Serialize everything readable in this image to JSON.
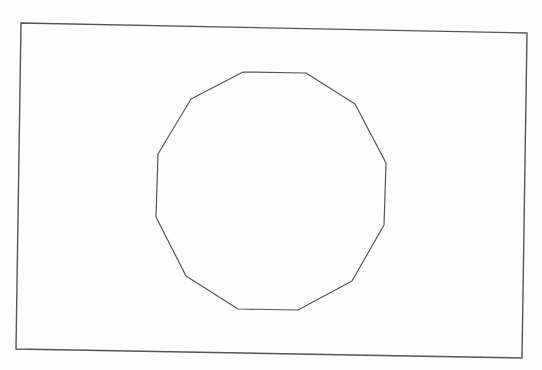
{
  "diagram": {
    "width": 542,
    "height": 370,
    "background": "#fefefe",
    "stroke_color": "#555555",
    "frame": {
      "shape": "quadrilateral",
      "points": [
        [
          21,
          23
        ],
        [
          527,
          33
        ],
        [
          522,
          358
        ],
        [
          16,
          349
        ]
      ],
      "stroke_width": 1.4
    },
    "polygon": {
      "shape": "dodecagon",
      "sides": 12,
      "points": [
        [
          243,
          72
        ],
        [
          306,
          73
        ],
        [
          355,
          104
        ],
        [
          386,
          163
        ],
        [
          384,
          225
        ],
        [
          352,
          281
        ],
        [
          298,
          310
        ],
        [
          238,
          309
        ],
        [
          186,
          276
        ],
        [
          156,
          217
        ],
        [
          158,
          154
        ],
        [
          191,
          99
        ]
      ],
      "stroke_width": 1.2
    }
  }
}
